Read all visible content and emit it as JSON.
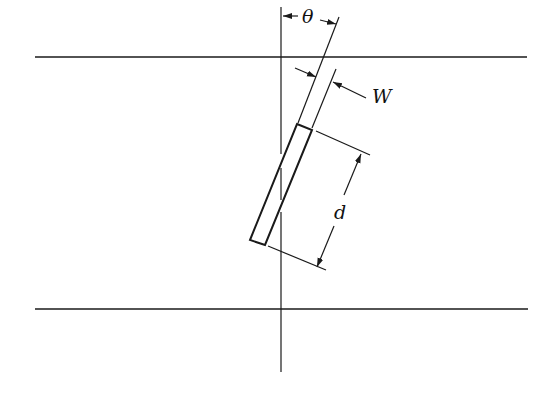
{
  "figure": {
    "type": "geometry-diagram",
    "labels": {
      "angle": "θ",
      "width": "W",
      "length": "d"
    },
    "colors": {
      "line": "#1a1a1a",
      "background": "#ffffff"
    }
  }
}
